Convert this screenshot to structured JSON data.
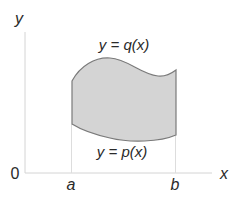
{
  "diagram": {
    "type": "area-between-curves",
    "axes": {
      "x_label": "x",
      "y_label": "y",
      "origin_label": "0",
      "color": "#d0d0d0"
    },
    "bounds": {
      "left_label": "a",
      "right_label": "b"
    },
    "curves": {
      "upper": {
        "label": "y = q(x)"
      },
      "lower": {
        "label": "y = p(x)"
      }
    },
    "region": {
      "fill": "#d2d2d2",
      "stroke": "#777777"
    }
  }
}
